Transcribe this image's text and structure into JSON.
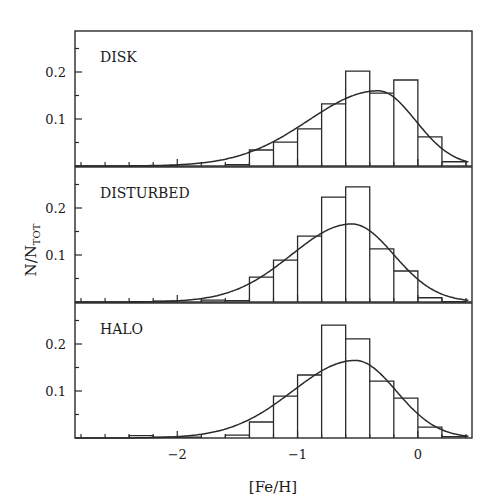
{
  "chart_data": {
    "type": "bar",
    "layout": "three vertically stacked panels sharing x-axis",
    "xlabel": "[Fe/H]",
    "ylabel": "N/N_TOT",
    "ylabel_main": "N/N",
    "ylabel_sub": "TOT",
    "xlim": [
      -2.85,
      0.45
    ],
    "ylim": [
      0,
      0.28
    ],
    "x_ticks_major": [
      -2,
      -1,
      0
    ],
    "x_tick_labels": [
      "−2",
      "−1",
      "0"
    ],
    "x_ticks_minor_step": 0.2,
    "y_ticks_major": [
      0.1,
      0.2
    ],
    "y_tick_labels": [
      "0.1",
      "0.2"
    ],
    "y_ticks_minor_step": 0.05,
    "bin_width": 0.2,
    "bin_edges": [
      -2.8,
      -2.6,
      -2.4,
      -2.2,
      -2.0,
      -1.8,
      -1.6,
      -1.4,
      -1.2,
      -1.0,
      -0.8,
      -0.6,
      -0.4,
      -0.2,
      0.0,
      0.2,
      0.4
    ],
    "panels": [
      {
        "label": "DISK",
        "histogram": [
          0.0,
          0.0,
          0.001,
          0.001,
          0.0,
          0.0,
          0.003,
          0.034,
          0.051,
          0.079,
          0.132,
          0.202,
          0.155,
          0.183,
          0.062,
          0.009
        ],
        "fit_curve": {
          "type": "skewed-gaussian",
          "peak_x": -0.33,
          "peak_y": 0.16,
          "sigma_left": 0.58,
          "sigma_right": 0.31
        }
      },
      {
        "label": "DISTURBED",
        "histogram": [
          0.0,
          0.0,
          0.001,
          0.002,
          0.0,
          0.004,
          0.003,
          0.053,
          0.089,
          0.14,
          0.223,
          0.245,
          0.113,
          0.066,
          0.009,
          0.001
        ],
        "fit_curve": {
          "type": "skewed-gaussian",
          "peak_x": -0.55,
          "peak_y": 0.166,
          "sigma_left": 0.5,
          "sigma_right": 0.35
        }
      },
      {
        "label": "HALO",
        "histogram": [
          0.0,
          0.0,
          0.005,
          0.002,
          0.002,
          0.0,
          0.006,
          0.034,
          0.089,
          0.134,
          0.24,
          0.211,
          0.121,
          0.085,
          0.023,
          0.003
        ],
        "fit_curve": {
          "type": "skewed-gaussian",
          "peak_x": -0.52,
          "peak_y": 0.165,
          "sigma_left": 0.52,
          "sigma_right": 0.34
        }
      }
    ],
    "grid": false,
    "legend": null
  }
}
